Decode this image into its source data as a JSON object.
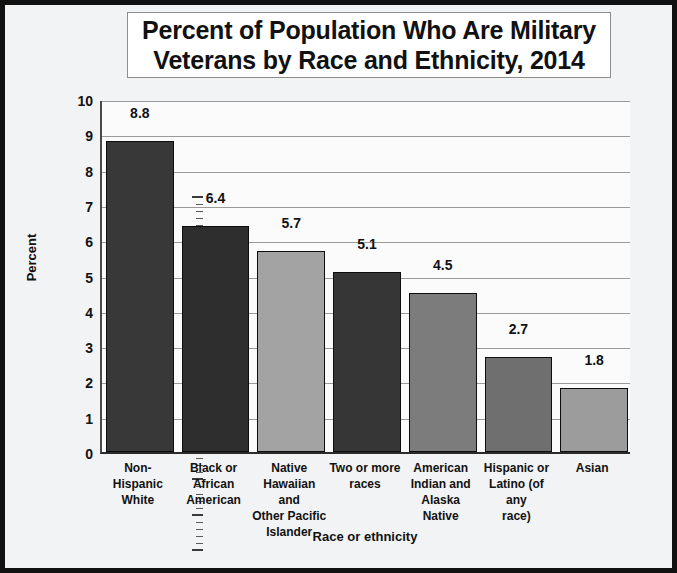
{
  "chart_data": {
    "type": "bar",
    "title": "Percent of Population Who Are Military Veterans by Race and Ethnicity, 2014",
    "title_lines": [
      "Percent of Population Who Are Military",
      "Veterans by Race and Ethnicity, 2014"
    ],
    "xlabel": "Race or ethnicity",
    "ylabel": "Percent",
    "ylim": [
      0,
      10
    ],
    "ytick_labels": [
      "0",
      "1",
      "2",
      "3",
      "4",
      "5",
      "6",
      "7",
      "8",
      "9",
      "10"
    ],
    "grid": true,
    "legend": "none",
    "minor_ticks_per_interval": 5,
    "categories": [
      "Non-Hispanic White",
      "Black or African American",
      "Native Hawaiian and Other Pacific Islander",
      "Two or more races",
      "American Indian and Alaska Native",
      "Hispanic or Latino (of any race)",
      "Asian"
    ],
    "category_label_lines": [
      [
        "Non-Hispanic",
        "White"
      ],
      [
        "Black or",
        "African",
        "American"
      ],
      [
        "Native",
        "Hawaiian and",
        "Other Pacific",
        "Islander"
      ],
      [
        "Two or more",
        "races"
      ],
      [
        "American",
        "Indian and",
        "Alaska Native"
      ],
      [
        "Hispanic or",
        "Latino (of any",
        "race)"
      ],
      [
        "Asian"
      ]
    ],
    "values": [
      8.8,
      6.4,
      5.7,
      5.1,
      4.5,
      2.7,
      1.8
    ],
    "value_labels": [
      "8.8",
      "6.4",
      "5.7",
      "5.1",
      "4.5",
      "2.7",
      "1.8"
    ],
    "bar_colors": [
      "#383838",
      "#2e2e2e",
      "#a3a3a3",
      "#363636",
      "#7c7c7c",
      "#6f6f6f",
      "#9c9c9c"
    ],
    "colors": {
      "figure_background": "#f2f3f4",
      "figure_border": "#111111",
      "plot_background": "#fbfbfc",
      "gridline": "#9a9a9a",
      "axis": "#2b2b2b",
      "text": "#111111",
      "title_box_background": "#ffffff"
    }
  }
}
